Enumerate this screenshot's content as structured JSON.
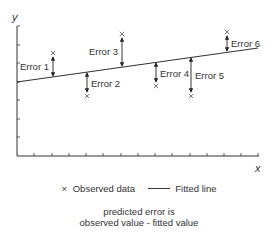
{
  "diagram": {
    "type": "regression-error-illustration",
    "axes": {
      "x_label": "x",
      "y_label": "y",
      "origin": [
        17,
        156
      ],
      "x_end": 259,
      "y_top": 26,
      "x_ticks": [
        34,
        52,
        69,
        86,
        103,
        121,
        138,
        155,
        172,
        190,
        207,
        224,
        241,
        258
      ],
      "y_ticks": [
        26,
        45,
        63,
        82,
        100,
        119,
        137
      ]
    },
    "fitted_line": {
      "x1": 17,
      "y1": 82,
      "x2": 258,
      "y2": 48
    },
    "errors": [
      {
        "label": "Error 1",
        "x": 53,
        "observed_y": 55,
        "fitted_y": 77,
        "direction": "above",
        "label_side": "left"
      },
      {
        "label": "Error 2",
        "x": 87,
        "observed_y": 94,
        "fitted_y": 72,
        "direction": "below",
        "label_side": "right"
      },
      {
        "label": "Error 3",
        "x": 122,
        "observed_y": 36,
        "fitted_y": 67,
        "direction": "above",
        "label_side": "left"
      },
      {
        "label": "Error 4",
        "x": 156,
        "observed_y": 84,
        "fitted_y": 62,
        "direction": "below",
        "label_side": "right"
      },
      {
        "label": "Error 5",
        "x": 191,
        "observed_y": 94,
        "fitted_y": 57,
        "direction": "below",
        "label_side": "right"
      },
      {
        "label": "Error 6",
        "x": 227,
        "observed_y": 34,
        "fitted_y": 52,
        "direction": "above",
        "label_side": "right"
      }
    ],
    "colors": {
      "ink": "#333333",
      "background": "#ffffff"
    }
  },
  "legend": {
    "observed_symbol": "×",
    "observed_label": "Observed data",
    "fitted_label": "Fitted line"
  },
  "caption": {
    "line1": "predicted error is",
    "line2": "observed value - fitted value"
  }
}
